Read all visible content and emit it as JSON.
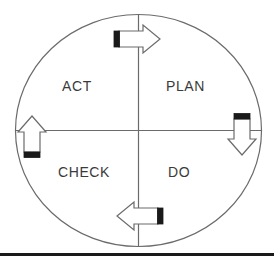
{
  "diagram": {
    "name": "PDCA Cycle (Deming Wheel)",
    "shape": "circle-with-quadrants",
    "colors": {
      "outline": "#6b6b6b",
      "crosshair": "#6b6b6b",
      "arrow_stroke": "#6b6b6b",
      "arrow_fill": "#ffffff",
      "arrow_tail": "#1a1a1a",
      "text": "#3a3a3a",
      "baseline": "#1a1a1a",
      "background": "#ffffff"
    },
    "quadrants": [
      {
        "id": "act",
        "label": "ACT",
        "position": "top-left"
      },
      {
        "id": "plan",
        "label": "PLAN",
        "position": "top-right"
      },
      {
        "id": "check",
        "label": "CHECK",
        "position": "bottom-left"
      },
      {
        "id": "do",
        "label": "DO",
        "position": "bottom-right"
      }
    ],
    "arrows": [
      {
        "id": "arrow-top",
        "direction": "right",
        "position": "top",
        "tail_side": "left",
        "icon": "arrow-right-icon"
      },
      {
        "id": "arrow-right",
        "direction": "down",
        "position": "right",
        "tail_side": "top",
        "icon": "arrow-down-icon"
      },
      {
        "id": "arrow-bottom",
        "direction": "left",
        "position": "bottom",
        "tail_side": "right",
        "icon": "arrow-left-icon"
      },
      {
        "id": "arrow-left",
        "direction": "up",
        "position": "left",
        "tail_side": "bottom",
        "icon": "arrow-up-icon"
      }
    ],
    "baseline": {
      "present": true,
      "orientation": "horizontal"
    }
  }
}
